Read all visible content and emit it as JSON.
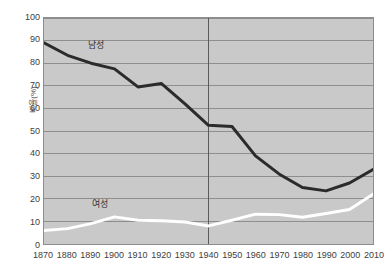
{
  "chart_data": {
    "type": "line",
    "title": "",
    "subtitle": "",
    "xlabel": "",
    "ylabel": "비율(%)",
    "xlim": [
      1870,
      2010
    ],
    "ylim": [
      0,
      100
    ],
    "grid": true,
    "legend_position": "inline-annotation",
    "background_color": "#c9c9c9",
    "gridline_color": "#8d8d8d",
    "categories": [
      1870,
      1880,
      1890,
      1900,
      1910,
      1920,
      1930,
      1940,
      1950,
      1960,
      1970,
      1980,
      1990,
      2000,
      2010
    ],
    "x_tick_labels": [
      "1870",
      "1880",
      "1890",
      "1900",
      "1910",
      "1920",
      "1930",
      "1940",
      "1950",
      "1960",
      "1970",
      "1980",
      "1990",
      "2000",
      "2010"
    ],
    "y_tick_labels": [
      "0",
      "10",
      "20",
      "30",
      "40",
      "50",
      "60",
      "70",
      "80",
      "90",
      "100"
    ],
    "y_ticks": [
      0,
      10,
      20,
      30,
      40,
      50,
      60,
      70,
      80,
      90,
      100
    ],
    "annotations": [
      {
        "name": "reference-line-1940",
        "type": "vertical-line",
        "x": 1940,
        "color": "#5a5a5a"
      }
    ],
    "series": [
      {
        "name": "남성",
        "label": "남성",
        "color": "#2b2b2b",
        "line_width": 3,
        "values": [
          89,
          83.5,
          80,
          77.5,
          69.5,
          71,
          62,
          52.5,
          52,
          39,
          31,
          25,
          23.5,
          27,
          33
        ]
      },
      {
        "name": "여성",
        "label": "여성",
        "color": "#ffffff",
        "line_width": 3,
        "values": [
          6,
          6.8,
          9,
          12,
          10.5,
          10.3,
          9.7,
          8,
          10.5,
          13.2,
          13,
          11.8,
          13.5,
          15.3,
          22
        ]
      }
    ]
  }
}
